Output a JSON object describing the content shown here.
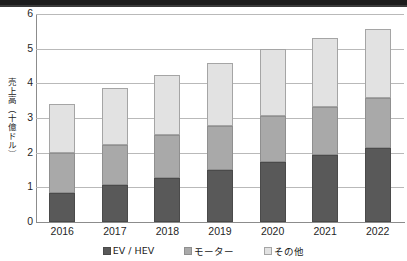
{
  "chart_data": {
    "type": "bar",
    "stacked": true,
    "title": "",
    "xlabel": "",
    "ylabel": "売上高（十億ドル）",
    "categories": [
      "2016",
      "2017",
      "2018",
      "2019",
      "2020",
      "2021",
      "2022"
    ],
    "series": [
      {
        "name": "EV / HEV",
        "color": "#595959",
        "values": [
          0.85,
          1.06,
          1.27,
          1.5,
          1.73,
          1.92,
          2.13
        ]
      },
      {
        "name": "モーター",
        "color": "#a9a9a9",
        "values": [
          1.15,
          1.15,
          1.23,
          1.28,
          1.33,
          1.39,
          1.44
        ]
      },
      {
        "name": "その他",
        "color": "#e2e2e2",
        "values": [
          1.41,
          1.65,
          1.75,
          1.82,
          1.93,
          1.99,
          2.0
        ]
      }
    ],
    "totals": [
      3.41,
      3.86,
      4.25,
      4.6,
      4.99,
      5.3,
      5.57
    ],
    "ylim": [
      0,
      6
    ],
    "yticks": [
      0,
      1,
      2,
      3,
      4,
      5,
      6
    ],
    "ytick_labels": [
      "0",
      "1",
      "2",
      "3",
      "4",
      "5",
      "6"
    ],
    "grid": true,
    "legend_position": "bottom"
  },
  "legend": {
    "items": [
      {
        "label": "EV / HEV",
        "swatch": "series-0-swatch"
      },
      {
        "label": "モーター",
        "swatch": "series-1-swatch"
      },
      {
        "label": "その他",
        "swatch": "series-2-swatch"
      }
    ]
  }
}
